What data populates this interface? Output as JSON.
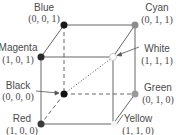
{
  "vertices": {
    "blue": {
      "name": "Blue",
      "coord": "(0, 0, 1)",
      "fill": "#1a1a1a"
    },
    "cyan": {
      "name": "Cyan",
      "coord": "(0, 1, 1)",
      "fill": "#8c8c8c"
    },
    "magenta": {
      "name": "Magenta",
      "coord": "(1, 0, 1)",
      "fill": "#2a2a2a"
    },
    "white": {
      "name": "White",
      "coord": "(1, 1, 1)",
      "fill": "#ffffff"
    },
    "black": {
      "name": "Black",
      "coord": "(0, 0, 0)",
      "fill": "#111111"
    },
    "green": {
      "name": "Green",
      "coord": "(0, 1, 0)",
      "fill": "#9a9a9a"
    },
    "red": {
      "name": "Red",
      "coord": "(1, 0, 0)",
      "fill": "#3a3a3a"
    },
    "yellow": {
      "name": "Yellow",
      "coord": "(1, 1, 0)",
      "fill": "#f4f4f4"
    }
  },
  "edge_color": "#555555"
}
